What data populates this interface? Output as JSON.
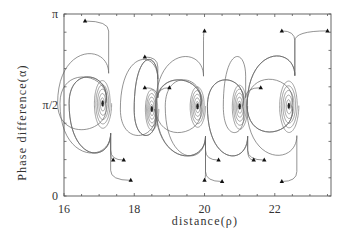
{
  "chart_data": {
    "type": "line",
    "title": "",
    "xlabel": "distance(ρ)",
    "ylabel": "Phase difference(α)",
    "xlim": [
      16,
      23.6
    ],
    "ylim": [
      0,
      3.1416
    ],
    "x_ticks": [
      16,
      18,
      20,
      22
    ],
    "x_tick_labels": [
      "16",
      "18",
      "20",
      "22"
    ],
    "y_ticks": [
      0,
      1.5708,
      3.1416
    ],
    "y_tick_labels": [
      "0",
      "π/2",
      "π"
    ],
    "grid": false,
    "legend": null,
    "foci": [
      {
        "x": 17.1,
        "y": 1.6
      },
      {
        "x": 18.5,
        "y": 1.5
      },
      {
        "x": 19.8,
        "y": 1.55
      },
      {
        "x": 21.0,
        "y": 1.55
      },
      {
        "x": 22.4,
        "y": 1.56
      }
    ],
    "start_markers": [
      {
        "x": 16.6,
        "y": 3.02
      },
      {
        "x": 17.4,
        "y": 0.62
      },
      {
        "x": 18.3,
        "y": 2.4
      },
      {
        "x": 18.3,
        "y": 1.87
      },
      {
        "x": 17.7,
        "y": 0.62
      },
      {
        "x": 17.9,
        "y": 0.27
      },
      {
        "x": 19.0,
        "y": 1.87
      },
      {
        "x": 20.0,
        "y": 2.85
      },
      {
        "x": 20.0,
        "y": 0.27
      },
      {
        "x": 20.4,
        "y": 0.62
      },
      {
        "x": 20.5,
        "y": 0.25
      },
      {
        "x": 21.4,
        "y": 0.62
      },
      {
        "x": 21.6,
        "y": 1.87
      },
      {
        "x": 21.7,
        "y": 0.62
      },
      {
        "x": 22.2,
        "y": 2.85
      },
      {
        "x": 22.2,
        "y": 0.25
      },
      {
        "x": 23.5,
        "y": 2.85
      }
    ]
  },
  "axes": {
    "x_label": "distance(ρ)",
    "y_label": "Phase difference(α)",
    "x_tick_labels": [
      "16",
      "18",
      "20",
      "22"
    ],
    "y_tick_labels": [
      "0",
      "π/2",
      "π"
    ]
  }
}
